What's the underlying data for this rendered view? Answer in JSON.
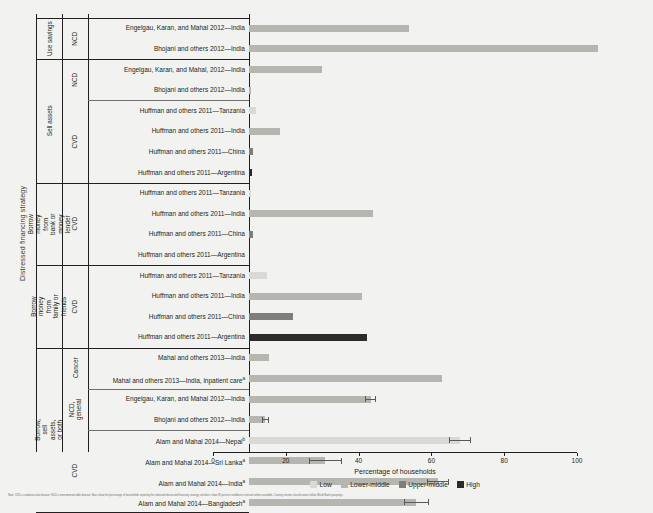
{
  "chart_data": {
    "type": "bar",
    "title": "",
    "xlabel": "Percentage of households",
    "ylabel": "Distressed financing strategy",
    "xlim": [
      0,
      100
    ],
    "xticks": [
      0,
      20,
      40,
      60,
      80,
      100
    ],
    "grid": false,
    "orientation": "horizontal",
    "legend_position": "bottom-center",
    "legend": [
      {
        "label": "Low",
        "color": "#d9d9d6"
      },
      {
        "label": "Lower-middle",
        "color": "#b6b6b1"
      },
      {
        "label": "Upper-middle",
        "color": "#7e7e7a"
      },
      {
        "label": "High",
        "color": "#2b2b2b"
      }
    ],
    "groups": [
      {
        "strategy": "Use savings",
        "diseases": [
          {
            "disease": "NCD",
            "rows": [
              {
                "label": "Engelgau, Karan, and Mahal 2012—India",
                "value": 44,
                "income": "Lower-middle",
                "error": null
              },
              {
                "label": "Bhojani and others 2012—India",
                "value": 96,
                "income": "Lower-middle",
                "error": null
              }
            ]
          }
        ]
      },
      {
        "strategy": "Sell assets",
        "diseases": [
          {
            "disease": "NCD",
            "rows": [
              {
                "label": "Engelgau, Karan, and Mahal, 2012—India",
                "value": 20,
                "income": "Lower-middle",
                "error": null
              },
              {
                "label": "Bhojani and others 2012—India",
                "value": 0.5,
                "income": "Lower-middle",
                "error": null
              }
            ]
          },
          {
            "disease": "CVD",
            "rows": [
              {
                "label": "Huffman and others 2011—Tanzania",
                "value": 1.8,
                "income": "Low",
                "error": null
              },
              {
                "label": "Huffman and others 2011—India",
                "value": 8.5,
                "income": "Lower-middle",
                "error": null
              },
              {
                "label": "Huffman and others 2011—China",
                "value": 1.0,
                "income": "Upper-middle",
                "error": null
              },
              {
                "label": "Huffman and others 2011—Argentina",
                "value": 0.8,
                "income": "High",
                "error": null
              }
            ]
          }
        ]
      },
      {
        "strategy": "Borrow money from bank or money lender",
        "diseases": [
          {
            "disease": "CVD",
            "rows": [
              {
                "label": "Huffman and others 2011—Tanzania",
                "value": 0.6,
                "income": "Low",
                "error": null
              },
              {
                "label": "Huffman and others 2011—India",
                "value": 34,
                "income": "Lower-middle",
                "error": null
              },
              {
                "label": "Huffman and others 2011—China",
                "value": 1.0,
                "income": "Upper-middle",
                "error": null
              },
              {
                "label": "Huffman and others 2011—Argentina",
                "value": 0.4,
                "income": "High",
                "error": null
              }
            ]
          }
        ]
      },
      {
        "strategy": "Borrow money from family or friends",
        "diseases": [
          {
            "disease": "CVD",
            "rows": [
              {
                "label": "Huffman and others 2011—Tanzania",
                "value": 5.0,
                "income": "Low",
                "error": null
              },
              {
                "label": "Huffman and others 2011—India",
                "value": 31,
                "income": "Lower-middle",
                "error": null
              },
              {
                "label": "Huffman and others 2011—China",
                "value": 12,
                "income": "Upper-middle",
                "error": null
              },
              {
                "label": "Huffman and others 2011—Argentina",
                "value": 32.5,
                "income": "High",
                "error": null
              }
            ]
          }
        ]
      },
      {
        "strategy": "Borrow, sell assets, or both",
        "diseases": [
          {
            "disease": "Cancer",
            "rows": [
              {
                "label": "Mahal and others 2013—India",
                "value": 5.5,
                "income": "Lower-middle",
                "error": null
              },
              {
                "label": "Mahal and others 2013—India, inpatient care",
                "superscript": "a",
                "value": 53,
                "income": "Lower-middle",
                "error": null
              }
            ]
          },
          {
            "disease": "NCD, general",
            "rows": [
              {
                "label": "Engelgau, Karan, and Mahal 2012—India",
                "value": 33.5,
                "income": "Lower-middle",
                "error": 1.5
              },
              {
                "label": "Bhojani and others 2012—India",
                "value": 4.5,
                "income": "Lower-middle",
                "error": 1.0
              }
            ]
          },
          {
            "disease": "CVD",
            "rows": [
              {
                "label": "Alam and Mahal 2014—Nepal",
                "superscript": "b",
                "value": 58,
                "income": "Low",
                "error": 3.0
              },
              {
                "label": "Alam and Mahal 2014—Sri Lanka",
                "superscript": "a",
                "value": 21,
                "income": "Lower-middle",
                "error": 4.5
              },
              {
                "label": "Alam and Mahal 2014—India",
                "superscript": "a",
                "value": 52,
                "income": "Lower-middle",
                "error": 3.0
              },
              {
                "label": "Alam and Mahal 2014—Bangladesh",
                "superscript": "a",
                "value": 46,
                "income": "Lower-middle",
                "error": 3.5
              }
            ]
          }
        ]
      }
    ]
  },
  "footnote": {
    "text": "Note: CVD = cardiovascular disease; NCD = noncommunicable disease. Bars show the percentage of households reporting the indicated distressed financing strategy; whiskers show 95 percent confidence intervals where available. Country income classifications follow World Bank groupings."
  }
}
